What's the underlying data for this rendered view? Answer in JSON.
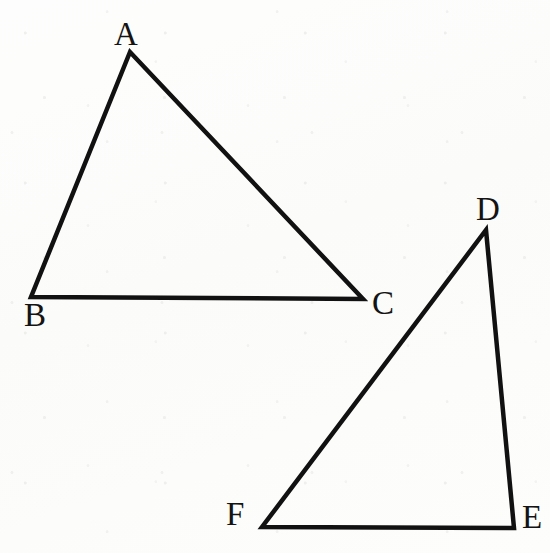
{
  "figure": {
    "background_color": "#fdfdfc",
    "stroke_color": "#111111",
    "label_color": "#141414",
    "stroke_width": 4.5,
    "canvas": {
      "width": 550,
      "height": 553
    }
  },
  "shapes": [
    {
      "id": "triangle-abc",
      "name": "triangle-abc",
      "vertex_order": "A,B,C",
      "points": "130,52 31,297 363,299",
      "closed": true
    },
    {
      "id": "triangle-def",
      "name": "triangle-def",
      "vertex_order": "D,E,F",
      "points": "486,230 514,528 262,527",
      "closed": true
    }
  ],
  "vertices": [
    {
      "id": "A",
      "label": "A",
      "point_x": 130,
      "point_y": 52,
      "label_x": 114,
      "label_y": 18
    },
    {
      "id": "B",
      "label": "B",
      "point_x": 31,
      "point_y": 297,
      "label_x": 24,
      "label_y": 299
    },
    {
      "id": "C",
      "label": "C",
      "point_x": 363,
      "point_y": 299,
      "label_x": 372,
      "label_y": 287
    },
    {
      "id": "D",
      "label": "D",
      "point_x": 486,
      "point_y": 230,
      "label_x": 476,
      "label_y": 193
    },
    {
      "id": "E",
      "label": "E",
      "point_x": 514,
      "point_y": 528,
      "label_x": 522,
      "label_y": 501
    },
    {
      "id": "F",
      "label": "F",
      "point_x": 262,
      "point_y": 527,
      "label_x": 226,
      "label_y": 498
    }
  ]
}
